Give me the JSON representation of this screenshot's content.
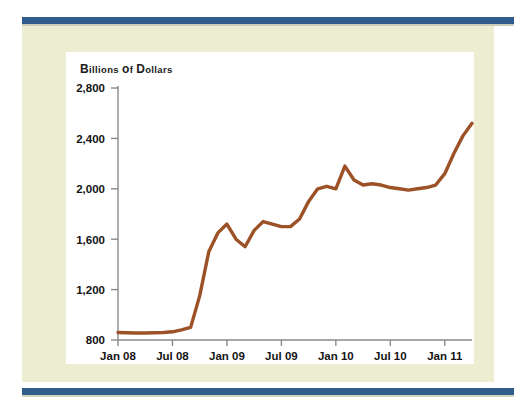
{
  "page": {
    "background_color": "#ffffff",
    "card_color": "#ededd1",
    "panel_color": "#ffffff",
    "rule_color": "#2f5c8a"
  },
  "chart_data": {
    "type": "line",
    "title": "Billions of Dollars",
    "title_parts": {
      "b": "B",
      "illions": "illions",
      "of_o": "o",
      "of_f": "f",
      "d": "D",
      "ollars": "ollars"
    },
    "xlabel": "",
    "ylabel": "Billions of Dollars",
    "line_color": "#9c5226",
    "axis_color": "#8a8a8a",
    "grid": false,
    "legend": null,
    "ylim": [
      800,
      2800
    ],
    "yticks": [
      800,
      1200,
      1600,
      2000,
      2400,
      2800
    ],
    "ytick_labels": [
      "800",
      "1,200",
      "1,600",
      "2,000",
      "2,400",
      "2,800"
    ],
    "xticks": [
      0,
      6,
      12,
      18,
      24,
      30,
      36
    ],
    "xtick_labels": [
      "Jan 08",
      "Jul 08",
      "Jan 09",
      "Jul 09",
      "Jan 10",
      "Jul 10",
      "Jan 11"
    ],
    "xlim": [
      0,
      39
    ],
    "x": [
      0,
      1,
      2,
      3,
      4,
      5,
      6,
      7,
      8,
      9,
      10,
      11,
      12,
      13,
      14,
      15,
      16,
      17,
      18,
      19,
      20,
      21,
      22,
      23,
      24,
      25,
      26,
      27,
      28,
      29,
      30,
      31,
      32,
      33,
      34,
      35,
      36,
      37,
      38,
      39
    ],
    "values": [
      860,
      858,
      856,
      856,
      858,
      860,
      865,
      880,
      900,
      1150,
      1500,
      1650,
      1720,
      1600,
      1540,
      1670,
      1740,
      1720,
      1700,
      1700,
      1760,
      1900,
      2000,
      2020,
      2000,
      2180,
      2070,
      2030,
      2040,
      2030,
      2010,
      2000,
      1990,
      2000,
      2010,
      2030,
      2120,
      2280,
      2420,
      2520
    ]
  }
}
